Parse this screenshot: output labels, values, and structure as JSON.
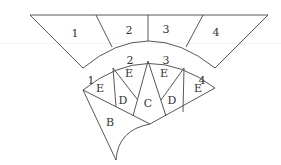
{
  "diagram": {
    "type": "fan-pattern",
    "stroke_color": "#444444",
    "top_band": {
      "labels": [
        {
          "text": "1",
          "x": 75,
          "y": 37
        },
        {
          "text": "2",
          "x": 129,
          "y": 34
        },
        {
          "text": "3",
          "x": 166,
          "y": 33
        },
        {
          "text": "4",
          "x": 216,
          "y": 36
        }
      ]
    },
    "arc_labels": [
      {
        "text": "1",
        "x": 91,
        "y": 84
      },
      {
        "text": "2",
        "x": 130,
        "y": 64
      },
      {
        "text": "3",
        "x": 166,
        "y": 64
      },
      {
        "text": "4",
        "x": 202,
        "y": 84
      }
    ],
    "fan_regions": [
      {
        "text": "E",
        "x": 100,
        "y": 92
      },
      {
        "text": "E",
        "x": 129,
        "y": 77
      },
      {
        "text": "D",
        "x": 123,
        "y": 104
      },
      {
        "text": "C",
        "x": 148,
        "y": 107
      },
      {
        "text": "E",
        "x": 164,
        "y": 77
      },
      {
        "text": "D",
        "x": 172,
        "y": 104
      },
      {
        "text": "E",
        "x": 198,
        "y": 92
      },
      {
        "text": "B",
        "x": 110,
        "y": 126
      }
    ]
  }
}
